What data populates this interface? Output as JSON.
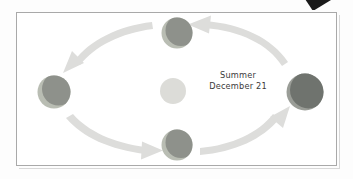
{
  "diagram": {
    "caption": {
      "season": "Summer",
      "date": "December 21"
    },
    "orbit": {
      "direction": "counterclockwise",
      "center_body": "sun",
      "position_count": 4
    },
    "bodies": [
      {
        "name": "earth-top",
        "cx": 177,
        "cy": 33,
        "r": 15.5,
        "lit_color": "#b9bdb3",
        "dark_color": "#8e918b",
        "dark_dx": 4.0,
        "dark_dy": -2.5
      },
      {
        "name": "earth-left",
        "cx": 54,
        "cy": 92,
        "r": 16.5,
        "lit_color": "#b9bdb3",
        "dark_color": "#8e918b",
        "dark_dx": 4.5,
        "dark_dy": -3.0
      },
      {
        "name": "earth-bottom",
        "cx": 177,
        "cy": 145,
        "r": 15.5,
        "lit_color": "#b9bdb3",
        "dark_color": "#8e918b",
        "dark_dx": 4.0,
        "dark_dy": -2.5
      },
      {
        "name": "earth-right",
        "cx": 305,
        "cy": 92,
        "r": 18.5,
        "lit_color": "#9a9d97",
        "dark_color": "#6f736e",
        "dark_dx": 3.5,
        "dark_dy": -2.0
      },
      {
        "name": "sun",
        "cx": 173,
        "cy": 91,
        "r": 13.0,
        "lit_color": "#dcdcd8",
        "dark_color": "#dcdcd8",
        "dark_dx": 0,
        "dark_dy": 0
      }
    ],
    "arrows": [
      {
        "name": "arrow-top-left",
        "points_to": "earth-left",
        "color": "#dcdcda"
      },
      {
        "name": "arrow-top-right",
        "points_to": "earth-top",
        "color": "#dcdcda"
      },
      {
        "name": "arrow-bottom-left",
        "points_to": "earth-bottom",
        "color": "#dcdcda"
      },
      {
        "name": "arrow-bottom-right",
        "points_to": "earth-right",
        "color": "#dcdcda"
      }
    ],
    "corner_mark": {
      "name": "page-corner-wedge",
      "color": "#1a1a1a"
    },
    "frame": {
      "border_color": "#a9a9a9",
      "background": "#ffffff"
    }
  }
}
